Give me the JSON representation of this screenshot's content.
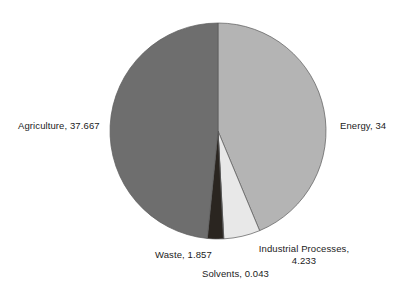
{
  "chart_data": {
    "type": "pie",
    "title": "",
    "subtitle": "",
    "xlabel": "",
    "ylabel": "",
    "grid": false,
    "legend": "none",
    "labels_position": "outside",
    "start_angle_deg": 0,
    "direction": "clockwise",
    "total": 77.8,
    "categories": [
      "Energy",
      "Industrial Processes",
      "Solvents",
      "Waste",
      "Agriculture"
    ],
    "values": [
      34,
      4.233,
      0.043,
      1.857,
      37.667
    ],
    "colors": [
      "#b4b4b4",
      "#e8e8e8",
      "#efefef",
      "#2a2520",
      "#6e6e6e"
    ],
    "slices": [
      {
        "name": "Energy",
        "value": 34,
        "label": "Energy, 34",
        "color": "#b4b4b4",
        "start_deg": 0,
        "end_deg": 157.33
      },
      {
        "name": "Industrial Processes",
        "value": 4.233,
        "label_line1": "Industrial Processes,",
        "label_line2": "4.233",
        "label": "Industrial Processes, 4.233",
        "color": "#e8e8e8",
        "start_deg": 157.33,
        "end_deg": 176.92
      },
      {
        "name": "Solvents",
        "value": 0.043,
        "label": "Solvents, 0.043",
        "color": "#efefef",
        "start_deg": 176.92,
        "end_deg": 177.12
      },
      {
        "name": "Waste",
        "value": 1.857,
        "label": "Waste, 1.857",
        "color": "#2a2520",
        "start_deg": 177.12,
        "end_deg": 185.71
      },
      {
        "name": "Agriculture",
        "value": 37.667,
        "label": "Agriculture, 37.667",
        "color": "#6e6e6e",
        "start_deg": 185.71,
        "end_deg": 360
      }
    ],
    "geometry": {
      "center_x": 218,
      "center_y": 131,
      "radius": 108
    }
  },
  "labels": {
    "agriculture": "Agriculture, 37.667",
    "energy": "Energy, 34",
    "waste": "Waste, 1.857",
    "industrial_line1": "Industrial Processes,",
    "industrial_line2": "4.233",
    "solvents": "Solvents, 0.043"
  }
}
